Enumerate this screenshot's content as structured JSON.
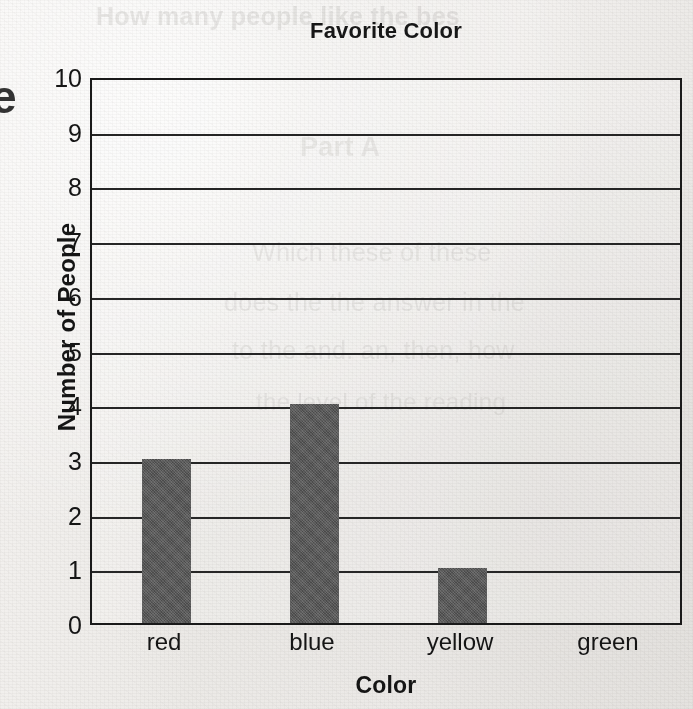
{
  "chart_data": {
    "type": "bar",
    "title": "Favorite Color",
    "xlabel": "Color",
    "ylabel": "Number of People",
    "categories": [
      "red",
      "blue",
      "yellow",
      "green"
    ],
    "values": [
      3,
      4,
      1,
      0
    ],
    "ylim": [
      0,
      10
    ],
    "ytick_labels": [
      "10",
      "9",
      "8",
      "7",
      "6",
      "5",
      "4",
      "3",
      "2",
      "1",
      "0"
    ],
    "ytick_values": [
      10,
      9,
      8,
      7,
      6,
      5,
      4,
      3,
      2,
      1,
      0
    ],
    "grid": true,
    "legend": false,
    "bar_color": "#5a5a5a",
    "axis_color": "#1a1a1a",
    "background_color": "#f1efed"
  },
  "ghosts": {
    "left_edge_glyph": "e",
    "top_line": "How many people like the bes",
    "part_line": "Part A",
    "line_1": "Which these of these",
    "line_2": "does the the answer in the",
    "line_3": "to the and. an, then, how",
    "line_4": "the level of the reading"
  }
}
